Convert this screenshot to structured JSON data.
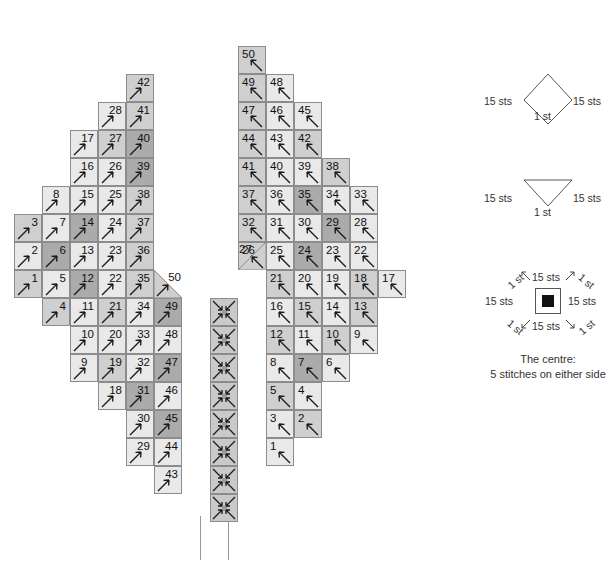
{
  "meta": {
    "cell_size_px": 28,
    "shades": {
      "light": "#e9e9e9",
      "medium": "#cfcfcf",
      "dark": "#ababab",
      "centre": "#c9c9c9"
    },
    "grid_origin": {
      "x": 14,
      "y": 18
    }
  },
  "chart_data": {
    "type": "heatmap",
    "xlabel": "",
    "ylabel": "",
    "legend_entries": [
      "diamond-15sts-1st",
      "triangle-15sts-1st",
      "square-centre-15sts-1st"
    ],
    "left_wing": {
      "arrow": "up-right",
      "cells": [
        {
          "c": 0,
          "r": 7,
          "n": "3",
          "s": "medium"
        },
        {
          "c": 0,
          "r": 8,
          "n": "2",
          "s": "light"
        },
        {
          "c": 0,
          "r": 9,
          "n": "1",
          "s": "medium"
        },
        {
          "c": 1,
          "r": 6,
          "n": "8",
          "s": "light",
          "tight": true
        },
        {
          "c": 1,
          "r": 7,
          "n": "7",
          "s": "light"
        },
        {
          "c": 1,
          "r": 8,
          "n": "6",
          "s": "dark"
        },
        {
          "c": 1,
          "r": 9,
          "n": "5",
          "s": "light"
        },
        {
          "c": 1,
          "r": 10,
          "n": "4",
          "s": "medium"
        },
        {
          "c": 2,
          "r": 4,
          "n": "17",
          "s": "light"
        },
        {
          "c": 2,
          "r": 5,
          "n": "16",
          "s": "light",
          "tight": true
        },
        {
          "c": 2,
          "r": 6,
          "n": "15",
          "s": "light"
        },
        {
          "c": 2,
          "r": 7,
          "n": "14",
          "s": "dark"
        },
        {
          "c": 2,
          "r": 8,
          "n": "13",
          "s": "light"
        },
        {
          "c": 2,
          "r": 9,
          "n": "12",
          "s": "dark"
        },
        {
          "c": 2,
          "r": 10,
          "n": "11",
          "s": "light"
        },
        {
          "c": 2,
          "r": 11,
          "n": "10",
          "s": "light"
        },
        {
          "c": 2,
          "r": 12,
          "n": "9",
          "s": "light",
          "tight": true
        },
        {
          "c": 3,
          "r": 3,
          "n": "28",
          "s": "light",
          "tight": true
        },
        {
          "c": 3,
          "r": 4,
          "n": "27",
          "s": "medium"
        },
        {
          "c": 3,
          "r": 5,
          "n": "26",
          "s": "light",
          "tight": true
        },
        {
          "c": 3,
          "r": 6,
          "n": "25",
          "s": "light"
        },
        {
          "c": 3,
          "r": 7,
          "n": "24",
          "s": "light"
        },
        {
          "c": 3,
          "r": 8,
          "n": "23",
          "s": "light"
        },
        {
          "c": 3,
          "r": 9,
          "n": "22",
          "s": "light"
        },
        {
          "c": 3,
          "r": 10,
          "n": "21",
          "s": "medium"
        },
        {
          "c": 3,
          "r": 11,
          "n": "20",
          "s": "light"
        },
        {
          "c": 3,
          "r": 12,
          "n": "19",
          "s": "medium"
        },
        {
          "c": 3,
          "r": 13,
          "n": "18",
          "s": "light"
        },
        {
          "c": 4,
          "r": 2,
          "n": "42",
          "s": "medium"
        },
        {
          "c": 4,
          "r": 3,
          "n": "41",
          "s": "medium"
        },
        {
          "c": 4,
          "r": 4,
          "n": "40",
          "s": "dark"
        },
        {
          "c": 4,
          "r": 5,
          "n": "39",
          "s": "dark",
          "tight": true
        },
        {
          "c": 4,
          "r": 6,
          "n": "38",
          "s": "medium"
        },
        {
          "c": 4,
          "r": 7,
          "n": "37",
          "s": "medium"
        },
        {
          "c": 4,
          "r": 8,
          "n": "36",
          "s": "medium"
        },
        {
          "c": 4,
          "r": 9,
          "n": "35",
          "s": "medium"
        },
        {
          "c": 4,
          "r": 10,
          "n": "34",
          "s": "light"
        },
        {
          "c": 4,
          "r": 11,
          "n": "33",
          "s": "light"
        },
        {
          "c": 4,
          "r": 12,
          "n": "32",
          "s": "light"
        },
        {
          "c": 4,
          "r": 13,
          "n": "31",
          "s": "dark"
        },
        {
          "c": 4,
          "r": 14,
          "n": "30",
          "s": "light"
        },
        {
          "c": 4,
          "r": 15,
          "n": "29",
          "s": "light",
          "tight": true
        },
        {
          "c": 5,
          "r": 10,
          "n": "49",
          "s": "dark"
        },
        {
          "c": 5,
          "r": 11,
          "n": "48",
          "s": "light"
        },
        {
          "c": 5,
          "r": 12,
          "n": "47",
          "s": "dark"
        },
        {
          "c": 5,
          "r": 13,
          "n": "46",
          "s": "light"
        },
        {
          "c": 5,
          "r": 14,
          "n": "45",
          "s": "dark"
        },
        {
          "c": 5,
          "r": 15,
          "n": "44",
          "s": "light",
          "tight": true
        },
        {
          "c": 5,
          "r": 16,
          "n": "43",
          "s": "light"
        }
      ],
      "corner_cell": {
        "c": 5,
        "r": 9,
        "n": "50",
        "s": "medium",
        "shape": "triangle"
      }
    },
    "right_wing": {
      "arrow": "up-left",
      "cells": [
        {
          "c": 0,
          "r": 1,
          "n": "50",
          "s": "medium"
        },
        {
          "c": 0,
          "r": 2,
          "n": "49",
          "s": "medium"
        },
        {
          "c": 0,
          "r": 3,
          "n": "47",
          "s": "medium"
        },
        {
          "c": 0,
          "r": 4,
          "n": "44",
          "s": "medium"
        },
        {
          "c": 0,
          "r": 5,
          "n": "41",
          "s": "medium"
        },
        {
          "c": 0,
          "r": 6,
          "n": "37",
          "s": "medium"
        },
        {
          "c": 0,
          "r": 7,
          "n": "32",
          "s": "medium"
        },
        {
          "c": 0,
          "r": 8,
          "n": "26",
          "s": "medium"
        },
        {
          "c": 1,
          "r": 2,
          "n": "48",
          "s": "light"
        },
        {
          "c": 1,
          "r": 3,
          "n": "46",
          "s": "light"
        },
        {
          "c": 1,
          "r": 4,
          "n": "43",
          "s": "light"
        },
        {
          "c": 1,
          "r": 5,
          "n": "40",
          "s": "light"
        },
        {
          "c": 1,
          "r": 6,
          "n": "36",
          "s": "light"
        },
        {
          "c": 1,
          "r": 7,
          "n": "31",
          "s": "light"
        },
        {
          "c": 1,
          "r": 8,
          "n": "25",
          "s": "light"
        },
        {
          "c": 1,
          "r": 9,
          "n": "21",
          "s": "medium"
        },
        {
          "c": 1,
          "r": 10,
          "n": "16",
          "s": "light"
        },
        {
          "c": 1,
          "r": 11,
          "n": "12",
          "s": "medium"
        },
        {
          "c": 1,
          "r": 12,
          "n": "8",
          "s": "light"
        },
        {
          "c": 1,
          "r": 13,
          "n": "5",
          "s": "medium"
        },
        {
          "c": 1,
          "r": 14,
          "n": "3",
          "s": "light"
        },
        {
          "c": 1,
          "r": 15,
          "n": "1",
          "s": "light"
        },
        {
          "c": 2,
          "r": 3,
          "n": "45",
          "s": "light"
        },
        {
          "c": 2,
          "r": 4,
          "n": "42",
          "s": "medium"
        },
        {
          "c": 2,
          "r": 5,
          "n": "39",
          "s": "light"
        },
        {
          "c": 2,
          "r": 6,
          "n": "35",
          "s": "dark"
        },
        {
          "c": 2,
          "r": 7,
          "n": "30",
          "s": "light"
        },
        {
          "c": 2,
          "r": 8,
          "n": "24",
          "s": "dark"
        },
        {
          "c": 2,
          "r": 9,
          "n": "20",
          "s": "light"
        },
        {
          "c": 2,
          "r": 10,
          "n": "15",
          "s": "medium"
        },
        {
          "c": 2,
          "r": 11,
          "n": "11",
          "s": "light"
        },
        {
          "c": 2,
          "r": 12,
          "n": "7",
          "s": "dark"
        },
        {
          "c": 2,
          "r": 13,
          "n": "4",
          "s": "light"
        },
        {
          "c": 2,
          "r": 14,
          "n": "2",
          "s": "medium"
        },
        {
          "c": 3,
          "r": 5,
          "n": "38",
          "s": "medium"
        },
        {
          "c": 3,
          "r": 6,
          "n": "34",
          "s": "light"
        },
        {
          "c": 3,
          "r": 7,
          "n": "29",
          "s": "dark"
        },
        {
          "c": 3,
          "r": 8,
          "n": "23",
          "s": "light"
        },
        {
          "c": 3,
          "r": 9,
          "n": "19",
          "s": "light"
        },
        {
          "c": 3,
          "r": 10,
          "n": "14",
          "s": "light"
        },
        {
          "c": 3,
          "r": 11,
          "n": "10",
          "s": "medium"
        },
        {
          "c": 3,
          "r": 12,
          "n": "6",
          "s": "light"
        },
        {
          "c": 4,
          "r": 6,
          "n": "33",
          "s": "light"
        },
        {
          "c": 4,
          "r": 7,
          "n": "28",
          "s": "light"
        },
        {
          "c": 4,
          "r": 8,
          "n": "22",
          "s": "light"
        },
        {
          "c": 4,
          "r": 9,
          "n": "18",
          "s": "medium"
        },
        {
          "c": 4,
          "r": 10,
          "n": "13",
          "s": "medium"
        },
        {
          "c": 4,
          "r": 11,
          "n": "9",
          "s": "light"
        },
        {
          "c": 5,
          "r": 9,
          "n": "17",
          "s": "light"
        }
      ],
      "corner_cell": {
        "c": 0,
        "r": 8,
        "n": "27",
        "s": "medium",
        "shape": "triangle"
      }
    },
    "centre_column": {
      "rows": [
        10,
        11,
        12,
        13,
        14,
        15,
        16,
        17
      ],
      "marker": "four-converging-arrows"
    }
  },
  "legend": {
    "items": [
      {
        "id": "diamond",
        "shape": "diamond",
        "left_label": "15 sts",
        "right_label": "15 sts",
        "bottom_label": "1 st"
      },
      {
        "id": "triangle",
        "shape": "triangle-down",
        "left_label": "15 sts",
        "right_label": "15 sts",
        "bottom_label": "1 st"
      },
      {
        "id": "square-centre",
        "shape": "square-filled",
        "top_left_label": "1 st",
        "top_label": "15 sts",
        "top_right_label": "1 st",
        "left_label": "15 sts",
        "right_label": "15 sts",
        "bottom_left_label": "1 st",
        "bottom_label": "15 sts",
        "bottom_right_label": "1 st"
      }
    ],
    "caption_line1": "The centre:",
    "caption_line2": "5 stitches on either side"
  }
}
